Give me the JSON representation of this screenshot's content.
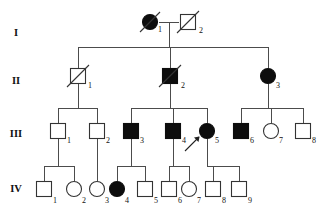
{
  "figure": {
    "type": "pedigree",
    "colors": {
      "affected_fill": "#0d0d0d",
      "unaffected_fill": "#ffffff",
      "stroke": "#333333",
      "line": "#4c4c4c",
      "text": "#111111"
    }
  },
  "generation_labels": [
    {
      "id": "gen-I",
      "label": "I",
      "y": 36
    },
    {
      "id": "gen-II",
      "label": "II",
      "y": 84
    },
    {
      "id": "gen-III",
      "label": "III",
      "y": 137
    },
    {
      "id": "gen-IV",
      "label": "IV",
      "y": 192
    }
  ],
  "legend": {
    "square_means": "male",
    "circle_means": "female",
    "filled_means": "affected",
    "slash_means": "deceased",
    "arrow_means": "proband"
  },
  "individuals": [
    {
      "id": "I-1",
      "number": "1",
      "generation": "I",
      "sex": "female",
      "shape": "circle",
      "affected": true,
      "deceased": true,
      "proband": false,
      "x": 150,
      "y": 22
    },
    {
      "id": "I-2",
      "number": "2",
      "generation": "I",
      "sex": "male",
      "shape": "square",
      "affected": false,
      "deceased": true,
      "proband": false,
      "x": 188,
      "y": 22
    },
    {
      "id": "II-1",
      "number": "1",
      "generation": "II",
      "sex": "male",
      "shape": "square",
      "affected": false,
      "deceased": true,
      "proband": false,
      "x": 78,
      "y": 76
    },
    {
      "id": "II-2",
      "number": "2",
      "generation": "II",
      "sex": "male",
      "shape": "square",
      "affected": true,
      "deceased": true,
      "proband": false,
      "x": 170,
      "y": 76
    },
    {
      "id": "II-3",
      "number": "3",
      "generation": "II",
      "sex": "female",
      "shape": "circle",
      "affected": true,
      "deceased": false,
      "proband": false,
      "x": 268,
      "y": 76
    },
    {
      "id": "III-1",
      "number": "1",
      "generation": "III",
      "sex": "male",
      "shape": "square",
      "affected": false,
      "deceased": false,
      "proband": false,
      "x": 58,
      "y": 131
    },
    {
      "id": "III-2",
      "number": "2",
      "generation": "III",
      "sex": "male",
      "shape": "square",
      "affected": false,
      "deceased": false,
      "proband": false,
      "x": 97,
      "y": 131
    },
    {
      "id": "III-3",
      "number": "3",
      "generation": "III",
      "sex": "male",
      "shape": "square",
      "affected": true,
      "deceased": false,
      "proband": false,
      "x": 131,
      "y": 131
    },
    {
      "id": "III-4",
      "number": "4",
      "generation": "III",
      "sex": "male",
      "shape": "square",
      "affected": true,
      "deceased": false,
      "proband": false,
      "x": 173,
      "y": 131
    },
    {
      "id": "III-5",
      "number": "5",
      "generation": "III",
      "sex": "female",
      "shape": "circle",
      "affected": true,
      "deceased": false,
      "proband": true,
      "x": 207,
      "y": 131
    },
    {
      "id": "III-6",
      "number": "6",
      "generation": "III",
      "sex": "male",
      "shape": "square",
      "affected": true,
      "deceased": false,
      "proband": false,
      "x": 241,
      "y": 131
    },
    {
      "id": "III-7",
      "number": "7",
      "generation": "III",
      "sex": "female",
      "shape": "circle",
      "affected": false,
      "deceased": false,
      "proband": false,
      "x": 271,
      "y": 131
    },
    {
      "id": "III-8",
      "number": "8",
      "generation": "III",
      "sex": "male",
      "shape": "square",
      "affected": false,
      "deceased": false,
      "proband": false,
      "x": 303,
      "y": 131
    },
    {
      "id": "IV-1",
      "number": "1",
      "generation": "IV",
      "sex": "male",
      "shape": "square",
      "affected": false,
      "deceased": false,
      "proband": false,
      "x": 44,
      "y": 189
    },
    {
      "id": "IV-2",
      "number": "2",
      "generation": "IV",
      "sex": "female",
      "shape": "circle",
      "affected": false,
      "deceased": false,
      "proband": false,
      "x": 74,
      "y": 189
    },
    {
      "id": "IV-3",
      "number": "3",
      "generation": "IV",
      "sex": "female",
      "shape": "circle",
      "affected": false,
      "deceased": false,
      "proband": false,
      "x": 97,
      "y": 189
    },
    {
      "id": "IV-4",
      "number": "4",
      "generation": "IV",
      "sex": "female",
      "shape": "circle",
      "affected": true,
      "deceased": false,
      "proband": false,
      "x": 117,
      "y": 189
    },
    {
      "id": "IV-5",
      "number": "5",
      "generation": "IV",
      "sex": "male",
      "shape": "square",
      "affected": false,
      "deceased": false,
      "proband": false,
      "x": 145,
      "y": 189
    },
    {
      "id": "IV-6",
      "number": "6",
      "generation": "IV",
      "sex": "male",
      "shape": "square",
      "affected": false,
      "deceased": false,
      "proband": false,
      "x": 169,
      "y": 189
    },
    {
      "id": "IV-7",
      "number": "7",
      "generation": "IV",
      "sex": "female",
      "shape": "circle",
      "affected": false,
      "deceased": false,
      "proband": false,
      "x": 189,
      "y": 189
    },
    {
      "id": "IV-8",
      "number": "8",
      "generation": "IV",
      "sex": "male",
      "shape": "square",
      "affected": false,
      "deceased": false,
      "proband": false,
      "x": 213,
      "y": 189
    },
    {
      "id": "IV-9",
      "number": "9",
      "generation": "IV",
      "sex": "male",
      "shape": "square",
      "affected": false,
      "deceased": false,
      "proband": false,
      "x": 239,
      "y": 189
    }
  ],
  "matings": [
    {
      "id": "mating-I",
      "partners": [
        "I-1",
        "I-2"
      ],
      "children": [
        "II-1",
        "II-2",
        "II-3"
      ]
    },
    {
      "id": "mating-II-1",
      "partners": [
        "II-1"
      ],
      "children": [
        "III-1",
        "III-2"
      ]
    },
    {
      "id": "mating-II-2",
      "partners": [
        "II-2"
      ],
      "children": [
        "III-3",
        "III-4",
        "III-5"
      ]
    },
    {
      "id": "mating-II-3",
      "partners": [
        "II-3"
      ],
      "children": [
        "III-6",
        "III-7",
        "III-8"
      ]
    },
    {
      "id": "mating-III-1",
      "partners": [
        "III-1"
      ],
      "children": [
        "IV-1",
        "IV-2"
      ]
    },
    {
      "id": "mating-III-2",
      "partners": [
        "III-2"
      ],
      "children": [
        "IV-3"
      ]
    },
    {
      "id": "mating-III-3",
      "partners": [
        "III-3"
      ],
      "children": [
        "IV-4",
        "IV-5"
      ]
    },
    {
      "id": "mating-III-4",
      "partners": [
        "III-4"
      ],
      "children": [
        "IV-6",
        "IV-7"
      ]
    },
    {
      "id": "mating-III-5",
      "partners": [
        "III-5"
      ],
      "children": [
        "IV-8",
        "IV-9"
      ]
    }
  ],
  "proband_marker": {
    "target": "III-5",
    "label": "arrow"
  }
}
